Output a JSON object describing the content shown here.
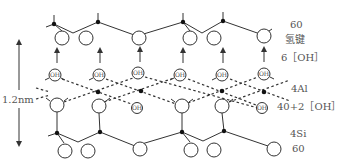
{
  "diagram": {
    "title": "",
    "type": "layered crystal structure (2:1 clay mineral sheet)",
    "colors": {
      "line": "#333333",
      "text": "#555555",
      "background": "#ffffff"
    },
    "scale_bar": {
      "label": "1.2nm",
      "direction": "vertical double arrow"
    },
    "layer_labels": [
      {
        "id": "top-o",
        "text": "60"
      },
      {
        "id": "hbond",
        "text": "氢键"
      },
      {
        "id": "oh-layer",
        "text": "6［OH］"
      },
      {
        "id": "al-layer",
        "text": "4Al"
      },
      {
        "id": "o-oh-layer",
        "text": "40+2［OH］"
      },
      {
        "id": "si-layer",
        "text": "4Si"
      },
      {
        "id": "bottom-o",
        "text": "60"
      }
    ],
    "hydroxyl_label": "OH",
    "atoms": {
      "top_si": [
        [
          54,
          24
        ],
        [
          98,
          22
        ],
        [
          183,
          22
        ],
        [
          223,
          21
        ]
      ],
      "top_o": [
        [
          62,
          38
        ],
        [
          86,
          38
        ],
        [
          139,
          38
        ],
        [
          190,
          38
        ],
        [
          214,
          38
        ],
        [
          264,
          36
        ]
      ],
      "hbond_arrows_x": [
        57,
        100,
        140,
        183,
        223,
        264
      ],
      "oh_upper": [
        [
          55,
          75
        ],
        [
          99,
          75
        ],
        [
          138,
          73
        ],
        [
          180,
          75
        ],
        [
          222,
          75
        ],
        [
          264,
          74
        ]
      ],
      "al": [
        [
          98,
          92
        ],
        [
          141,
          91
        ],
        [
          222,
          91
        ],
        [
          264,
          92
        ]
      ],
      "lower_o": [
        [
          57,
          105
        ],
        [
          99,
          106
        ],
        [
          182,
          106
        ],
        [
          222,
          106
        ]
      ],
      "oh_lower": [
        [
          137,
          108
        ],
        [
          262,
          108
        ]
      ],
      "bottom_si": [
        [
          57,
          133
        ],
        [
          100,
          132
        ],
        [
          182,
          132
        ],
        [
          224,
          131
        ]
      ],
      "bottom_o": [
        [
          65,
          151
        ],
        [
          88,
          151
        ],
        [
          140,
          149
        ],
        [
          191,
          150
        ],
        [
          214,
          150
        ],
        [
          274,
          149
        ]
      ]
    }
  }
}
